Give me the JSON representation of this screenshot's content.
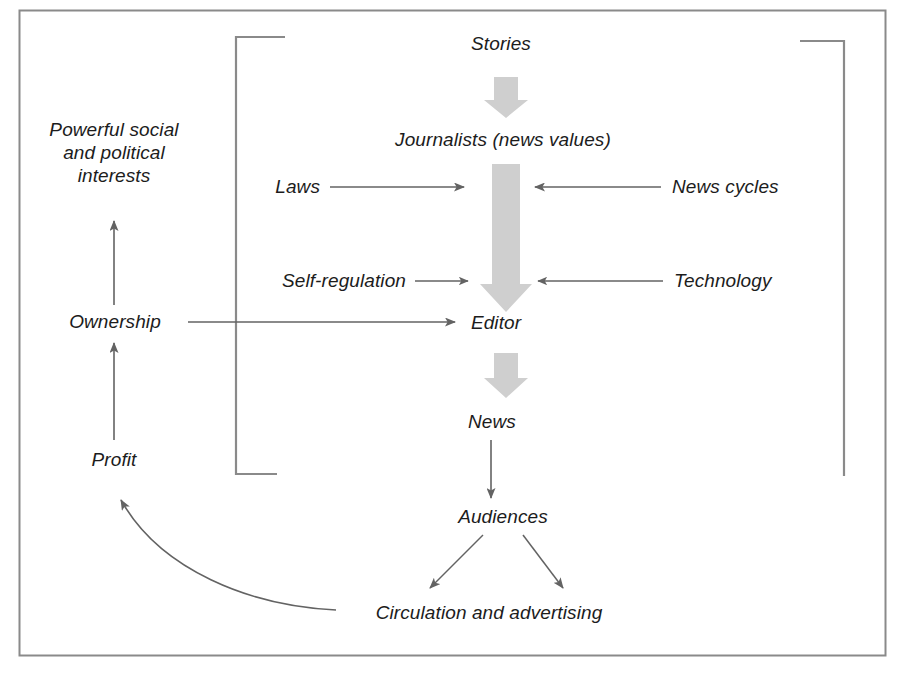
{
  "diagram": {
    "type": "flow-diagram",
    "frame": {
      "border_color": "#8a8a8a",
      "background": "#ffffff"
    },
    "colors": {
      "text": "#1c1c1c",
      "thin_arrow": "#636363",
      "thick_arrow": "#cfcfcf",
      "bracket": "#8a8a8a",
      "frame": "#8a8a8a"
    },
    "nodes": [
      {
        "id": "powerful-interests",
        "label": "Powerful social and political interests",
        "lines": [
          "Powerful social",
          "and political",
          "interests"
        ]
      },
      {
        "id": "ownership",
        "label": "Ownership"
      },
      {
        "id": "profit",
        "label": "Profit"
      },
      {
        "id": "stories",
        "label": "Stories"
      },
      {
        "id": "journalists",
        "label": "Journalists (news values)"
      },
      {
        "id": "laws",
        "label": "Laws"
      },
      {
        "id": "news-cycles",
        "label": "News cycles"
      },
      {
        "id": "self-regulation",
        "label": "Self-regulation"
      },
      {
        "id": "technology",
        "label": "Technology"
      },
      {
        "id": "editor",
        "label": "Editor"
      },
      {
        "id": "news",
        "label": "News"
      },
      {
        "id": "audiences",
        "label": "Audiences"
      },
      {
        "id": "circulation-advertising",
        "label": "Circulation and advertising"
      }
    ],
    "edges": [
      {
        "from": "stories",
        "to": "journalists",
        "style": "thick-gray-arrow",
        "direction": "down"
      },
      {
        "from": "journalists",
        "to": "editor",
        "style": "thick-gray-arrow",
        "direction": "down"
      },
      {
        "from": "editor",
        "to": "news",
        "style": "thick-gray-arrow",
        "direction": "down"
      },
      {
        "from": "laws",
        "to": "journalists-flow",
        "style": "thin-arrow",
        "direction": "right"
      },
      {
        "from": "news-cycles",
        "to": "journalists-flow",
        "style": "thin-arrow",
        "direction": "left"
      },
      {
        "from": "self-regulation",
        "to": "journalists-flow",
        "style": "thin-arrow",
        "direction": "right"
      },
      {
        "from": "technology",
        "to": "journalists-flow",
        "style": "thin-arrow",
        "direction": "left"
      },
      {
        "from": "ownership",
        "to": "editor",
        "style": "thin-arrow",
        "direction": "right"
      },
      {
        "from": "ownership",
        "to": "powerful-interests",
        "style": "thin-arrow",
        "direction": "up"
      },
      {
        "from": "profit",
        "to": "ownership",
        "style": "thin-arrow",
        "direction": "up"
      },
      {
        "from": "news",
        "to": "audiences",
        "style": "thin-arrow",
        "direction": "down"
      },
      {
        "from": "audiences",
        "to": "circulation-advertising",
        "style": "thin-arrow",
        "direction": "down-left"
      },
      {
        "from": "audiences",
        "to": "circulation-advertising",
        "style": "thin-arrow",
        "direction": "down-right"
      },
      {
        "from": "circulation-advertising",
        "to": "profit",
        "style": "thin-curved-arrow",
        "direction": "up-left"
      }
    ],
    "brackets": [
      {
        "id": "left-bracket",
        "side": "left"
      },
      {
        "id": "right-bracket",
        "side": "right"
      }
    ]
  }
}
